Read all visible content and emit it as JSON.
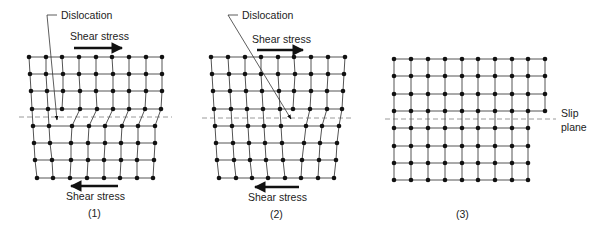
{
  "figure": {
    "type": "edge dislocation motion under shear stress",
    "panels": [
      {
        "id": "panel-1",
        "caption": "(1)",
        "dislocation_label": "Dislocation",
        "top_stress_label": "Shear stress",
        "bottom_stress_label": "Shear stress",
        "top_arrow_direction": "right",
        "bottom_arrow_direction": "left",
        "rows_above_slip": 4,
        "rows_below_slip": 4,
        "columns_above_slip": 9,
        "columns_below_slip": 8,
        "extra_half_plane_column": 2
      },
      {
        "id": "panel-2",
        "caption": "(2)",
        "dislocation_label": "Dislocation",
        "top_stress_label": "Shear stress",
        "bottom_stress_label": "Shear stress",
        "top_arrow_direction": "right",
        "bottom_arrow_direction": "left",
        "rows_above_slip": 4,
        "rows_below_slip": 4,
        "columns_above_slip": 9,
        "columns_below_slip": 8,
        "extra_half_plane_column": 6
      },
      {
        "id": "panel-3",
        "caption": "(3)",
        "slip_plane_label_line1": "Slip",
        "slip_plane_label_line2": "plane",
        "rows_above_slip": 4,
        "rows_below_slip": 4,
        "columns_above_slip": 10,
        "columns_below_slip": 9
      }
    ],
    "colors": {
      "atom": "#111111",
      "bond": "#555555",
      "slip_plane": "#9a9a9a",
      "text": "#222222"
    }
  }
}
